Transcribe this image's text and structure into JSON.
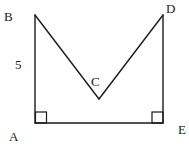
{
  "diagram": {
    "type": "geometry-figure",
    "stroke_color": "#1a1a1a",
    "background": "#ffffff",
    "points": {
      "A": {
        "label": "A",
        "x": 35,
        "y": 123
      },
      "B": {
        "label": "B",
        "x": 35,
        "y": 15
      },
      "C": {
        "label": "C",
        "x": 99,
        "y": 99
      },
      "D": {
        "label": "D",
        "x": 163,
        "y": 15
      },
      "E": {
        "label": "E",
        "x": 163,
        "y": 123
      }
    },
    "segments": [
      {
        "from": "A",
        "to": "B",
        "length_label": "5"
      },
      {
        "from": "B",
        "to": "C"
      },
      {
        "from": "C",
        "to": "D"
      },
      {
        "from": "D",
        "to": "E"
      },
      {
        "from": "E",
        "to": "A"
      }
    ],
    "right_angles": [
      "A",
      "E"
    ],
    "labels": {
      "A": "A",
      "B": "B",
      "C": "C",
      "D": "D",
      "E": "E",
      "side_AB": "5"
    }
  }
}
